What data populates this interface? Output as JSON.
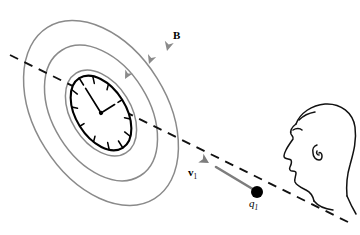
{
  "figure": {
    "type": "physics-diagram",
    "background_color": "#ffffff",
    "width": 360,
    "height": 235
  },
  "labels": {
    "magnetic_field": "B",
    "velocity_symbol": "v",
    "velocity_subscript": "1",
    "charge_symbol": "q",
    "charge_subscript": "1"
  },
  "colors": {
    "field_line": "#8a8a8a",
    "velocity_arrow": "#7d7d7d",
    "axis_dashed": "#111111",
    "clock_outline": "#000000",
    "head_outline": "#111111",
    "charge_dot": "#000000"
  },
  "elements": {
    "field_lines": {
      "name": "magnetic-field-lines",
      "count": 3,
      "shape": "concentric-ellipses",
      "center": [
        101,
        113
      ],
      "rotation_deg": -32,
      "radii": [
        {
          "rx": 30,
          "ry": 47
        },
        {
          "rx": 48,
          "ry": 74
        },
        {
          "rx": 66,
          "ry": 101
        }
      ],
      "arrow_direction": "clockwise-downward-on-right-side",
      "arrow_count": 3
    },
    "clock": {
      "name": "clock-face",
      "center": [
        101,
        113
      ],
      "rx": 25,
      "ry": 41,
      "rotation_deg": -32,
      "tick_count": 12,
      "hands": [
        "minute-hand-at-12",
        "hour-hand-at-3"
      ]
    },
    "axis": {
      "name": "motion-axis-dashed-line",
      "from": [
        10,
        55
      ],
      "to": [
        352,
        224
      ],
      "style": "dashed"
    },
    "velocity_vector": {
      "name": "velocity-arrow",
      "from": [
        256,
        191
      ],
      "to": [
        211,
        164
      ],
      "direction": "up-left-toward-observer-plane"
    },
    "charge": {
      "name": "point-charge-dot",
      "position": [
        257,
        192
      ],
      "radius": 6
    },
    "observer": {
      "name": "observer-head-profile",
      "facing": "left",
      "features": [
        "forehead",
        "brow",
        "nose",
        "lips",
        "chin",
        "ear",
        "neck",
        "shoulder"
      ]
    }
  }
}
